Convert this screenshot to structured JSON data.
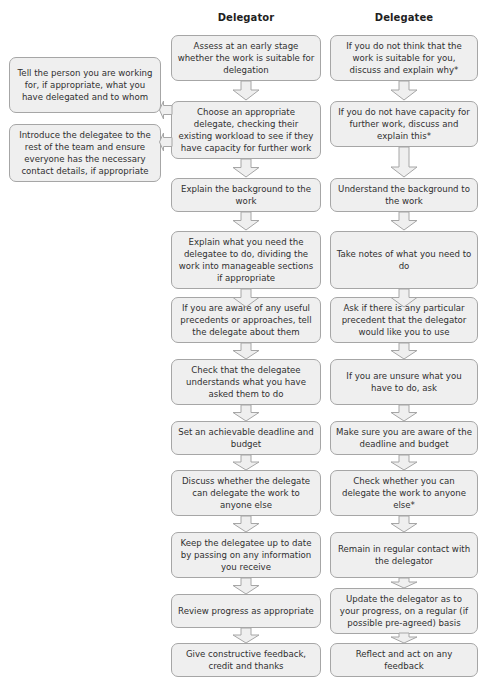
{
  "diagram": {
    "title_left": "Delegator",
    "title_right": "Delegatee",
    "colors": {
      "node_fill": "#efefef",
      "node_stroke": "#a6a6a6",
      "arrow_fill": "#efefef",
      "arrow_stroke": "#a6a6a6",
      "text": "#2f2f2f",
      "heading": "#1f1f1f",
      "background": "#ffffff"
    },
    "side_notes": [
      {
        "id": "note-tell-person",
        "text": "Tell the person you are working for, if appropriate, what you have delegated and to whom"
      },
      {
        "id": "note-introduce-delegatee",
        "text": "Introduce the delegatee to the rest of the team and ensure everyone has the necessary contact details, if appropriate"
      }
    ],
    "delegator_steps": [
      {
        "id": "d1",
        "text": "Assess at an early stage whether the work is suitable for delegation"
      },
      {
        "id": "d2",
        "text": "Choose an appropriate delegate, checking their existing workload to see if they have capacity for further work"
      },
      {
        "id": "d3",
        "text": "Explain the background to the work"
      },
      {
        "id": "d4",
        "text": "Explain what you need the delegatee to do, dividing the work into manageable sections if appropriate"
      },
      {
        "id": "d5",
        "text": "If you are aware of any useful precedents or approaches, tell the delegate about them"
      },
      {
        "id": "d6",
        "text": "Check that the delegatee understands what you have asked them to do"
      },
      {
        "id": "d7",
        "text": "Set an achievable deadline and budget"
      },
      {
        "id": "d8",
        "text": "Discuss whether the delegate can delegate the work to anyone else"
      },
      {
        "id": "d9",
        "text": "Keep the delegatee up to date by passing on any information you receive"
      },
      {
        "id": "d10",
        "text": "Review progress as appropriate"
      },
      {
        "id": "d11",
        "text": "Give constructive feedback, credit and thanks"
      }
    ],
    "delegatee_steps": [
      {
        "id": "e1",
        "text": "If you do not think that the work is suitable for you, discuss and explain why*"
      },
      {
        "id": "e2",
        "text": "If you do not have capacity for further work, discuss and explain this*"
      },
      {
        "id": "e3",
        "text": "Understand the background to the work"
      },
      {
        "id": "e4",
        "text": "Take notes of what you need to do"
      },
      {
        "id": "e5",
        "text": "Ask if there is any particular precedent that the delegator would like you to use"
      },
      {
        "id": "e6",
        "text": "If you are unsure what you have to do, ask"
      },
      {
        "id": "e7",
        "text": "Make sure you are aware of the deadline and budget"
      },
      {
        "id": "e8",
        "text": "Check whether you can delegate the work to anyone else*"
      },
      {
        "id": "e9",
        "text": "Remain in regular contact with the delegator"
      },
      {
        "id": "e10",
        "text": "Update the delegator as to your progress, on a regular (if possible pre-agreed) basis"
      },
      {
        "id": "e11",
        "text": "Reflect and act on any feedback"
      }
    ]
  }
}
